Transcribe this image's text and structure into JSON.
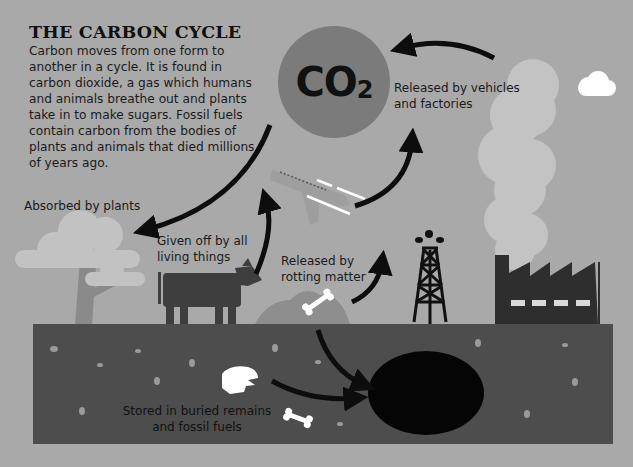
{
  "title": "THE CARBON CYCLE",
  "intro": "Carbon moves from one form to another in a cycle. It is found in carbon dioxide, a gas which humans and animals breathe out and plants take in to make sugars. Fossil fuels contain carbon from the bodies of plants and animals that died millions of years ago.",
  "co2": {
    "main": "CO",
    "sub": "2"
  },
  "labels": {
    "absorbed": "Absorbed by plants",
    "given_off_1": "Given off by all",
    "given_off_2": "living things",
    "rotting_1": "Released by",
    "rotting_2": "rotting matter",
    "vehicles_1": "Released by vehicles",
    "vehicles_2": "and factories",
    "stored_1": "Stored in buried remains",
    "stored_2": "and fossil fuels"
  },
  "colors": {
    "background": "#a9a9a9",
    "co2_circle": "#7b7b7b",
    "ground": "#4d4d4d",
    "arrow": "#0d0d0d",
    "smoke": "#c4c4c4"
  }
}
